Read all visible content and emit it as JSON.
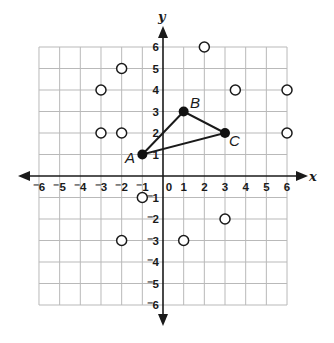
{
  "chart_data": {
    "type": "scatter",
    "title": "",
    "xlabel": "x",
    "ylabel": "y",
    "xlim": [
      -6,
      6
    ],
    "ylim": [
      -6,
      6
    ],
    "grid": true,
    "x_ticks": [
      "⁻6",
      "⁻5",
      "⁻4",
      "⁻3",
      "⁻2",
      "⁻1",
      "0",
      "1",
      "2",
      "3",
      "4",
      "5",
      "6"
    ],
    "y_ticks": [
      "6",
      "5",
      "4",
      "3",
      "2",
      "1",
      "⁻1",
      "⁻2",
      "⁻3",
      "⁻4",
      "⁻5",
      "⁻6"
    ],
    "series": [
      {
        "name": "triangle ABC",
        "style": "filled points connected as polygon",
        "points": [
          {
            "label": "A",
            "x": -1,
            "y": 1
          },
          {
            "label": "B",
            "x": 1,
            "y": 3
          },
          {
            "label": "C",
            "x": 3,
            "y": 2
          }
        ]
      },
      {
        "name": "open points",
        "style": "open circles",
        "points": [
          {
            "x": 2,
            "y": 6
          },
          {
            "x": -2,
            "y": 5
          },
          {
            "x": -3,
            "y": 4
          },
          {
            "x": 3.5,
            "y": 4
          },
          {
            "x": 6,
            "y": 4
          },
          {
            "x": -3,
            "y": 2
          },
          {
            "x": -2,
            "y": 2
          },
          {
            "x": 6,
            "y": 2
          },
          {
            "x": -1,
            "y": -1
          },
          {
            "x": 3,
            "y": -2
          },
          {
            "x": -2,
            "y": -3
          },
          {
            "x": 1,
            "y": -3
          }
        ]
      }
    ]
  },
  "labels": {
    "x_axis": "x",
    "y_axis": "y",
    "point_a": "A",
    "point_b": "B",
    "point_c": "C"
  }
}
